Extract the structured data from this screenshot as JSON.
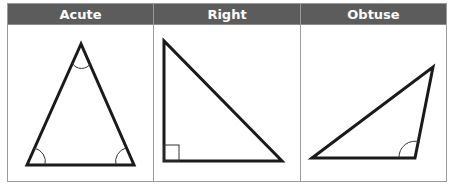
{
  "table": {
    "columns": [
      {
        "label": "Acute",
        "shape": "acute-triangle"
      },
      {
        "label": "Right",
        "shape": "right-triangle"
      },
      {
        "label": "Obtuse",
        "shape": "obtuse-triangle"
      }
    ]
  },
  "colors": {
    "header_bg": "#5c5c5c",
    "header_text": "#ffffff",
    "border": "#9a9a9a",
    "stroke": "#1a1a1a"
  }
}
